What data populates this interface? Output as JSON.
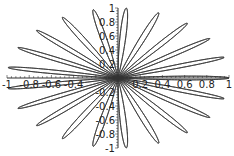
{
  "chart_data": {
    "type": "line",
    "subtype": "polar-rose",
    "title": "",
    "equation": "r = cos(21*theta)",
    "k": 21,
    "petal_count": 21,
    "theta_range": [
      0,
      6.283185307
    ],
    "samples": 4200,
    "xlabel": "",
    "ylabel": "",
    "xlim": [
      -1,
      1
    ],
    "ylim": [
      -1,
      1
    ],
    "grid": false,
    "legend": null,
    "axes_through_origin": true,
    "x_tick_labels": [
      {
        "value": -1,
        "label": "-1"
      },
      {
        "value": -0.8,
        "label": "-0.8"
      },
      {
        "value": -0.6,
        "label": "-0.6"
      },
      {
        "value": -0.4,
        "label": "-0.4"
      },
      {
        "value": 0.2,
        "label": "0.2"
      },
      {
        "value": 0.4,
        "label": "0.4"
      },
      {
        "value": 0.6,
        "label": "0.6"
      },
      {
        "value": 0.8,
        "label": "0.8"
      },
      {
        "value": 1,
        "label": "1"
      }
    ],
    "y_tick_labels": [
      {
        "value": 1,
        "label": "1"
      },
      {
        "value": 0.8,
        "label": "0.8"
      },
      {
        "value": 0.6,
        "label": "0.6"
      },
      {
        "value": 0.4,
        "label": "0.4"
      },
      {
        "value": 0.2,
        "label": "0.2"
      },
      {
        "value": -0.2,
        "label": "-0.2"
      },
      {
        "value": -0.4,
        "label": "-0.4"
      },
      {
        "value": -0.6,
        "label": "-0.6"
      },
      {
        "value": -0.8,
        "label": "-0.8"
      },
      {
        "value": -1,
        "label": "-1"
      }
    ],
    "petal_tip_angles_deg": [
      0,
      17.14,
      34.29,
      51.43,
      68.57,
      85.71,
      102.86,
      120,
      137.14,
      154.29,
      171.43,
      188.57,
      205.71,
      222.86,
      240,
      257.14,
      274.29,
      291.43,
      308.57,
      325.71,
      342.86
    ],
    "line_color": "#333333",
    "axis_color": "#333333"
  },
  "layout": {
    "origin_px": [
      118,
      78
    ],
    "x_scale_px": 111,
    "y_scale_px": 70
  }
}
